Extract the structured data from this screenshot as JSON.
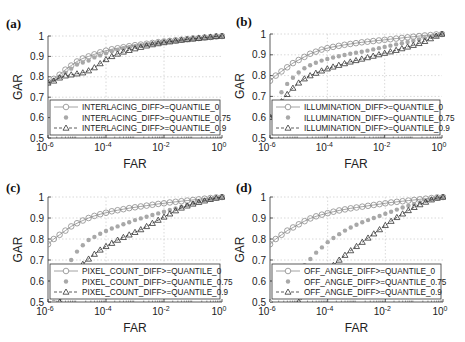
{
  "chart_data": [
    {
      "id": "a",
      "panel_label": "(a)",
      "type": "line",
      "xscale": "log",
      "xlabel": "FAR",
      "ylabel": "GAR",
      "xlim": [
        1e-06,
        1
      ],
      "ylim": [
        0.5,
        1
      ],
      "xticks": [
        {
          "base": "10",
          "exp": "-6"
        },
        {
          "base": "10",
          "exp": "-4"
        },
        {
          "base": "10",
          "exp": "-2"
        },
        {
          "base": "10",
          "exp": "0"
        }
      ],
      "yticks": [
        "0.5",
        "0.6",
        "0.7",
        "0.8",
        "0.9",
        "1"
      ],
      "grid": true,
      "legend_position": "bottom",
      "log10_far": [
        -6.0,
        -5.8,
        -5.6,
        -5.4,
        -5.2,
        -5.0,
        -4.8,
        -4.6,
        -4.4,
        -4.2,
        -4.0,
        -3.8,
        -3.6,
        -3.4,
        -3.2,
        -3.0,
        -2.8,
        -2.6,
        -2.4,
        -2.2,
        -2.0,
        -1.8,
        -1.6,
        -1.4,
        -1.2,
        -1.0,
        -0.8,
        -0.6,
        -0.4,
        -0.2,
        0.0
      ],
      "series": [
        {
          "name": "INTERLACING_DIFF>=QUANTILE_0",
          "marker": "circle",
          "line": "solid",
          "values": [
            0.775,
            0.79,
            0.81,
            0.835,
            0.855,
            0.875,
            0.89,
            0.9,
            0.91,
            0.92,
            0.928,
            0.935,
            0.94,
            0.945,
            0.95,
            0.955,
            0.958,
            0.962,
            0.966,
            0.97,
            0.973,
            0.976,
            0.979,
            0.982,
            0.985,
            0.988,
            0.99,
            0.993,
            0.995,
            0.998,
            1.0
          ]
        },
        {
          "name": "INTERLACING_DIFF>=QUANTILE_0.75",
          "marker": "dot",
          "line": "none",
          "values": [
            0.77,
            0.785,
            0.8,
            0.82,
            0.84,
            0.86,
            0.87,
            0.88,
            0.895,
            0.905,
            0.915,
            0.925,
            0.932,
            0.94,
            0.945,
            0.95,
            0.955,
            0.96,
            0.964,
            0.968,
            0.972,
            0.975,
            0.978,
            0.981,
            0.984,
            0.987,
            0.99,
            0.993,
            0.995,
            0.998,
            1.0
          ]
        },
        {
          "name": "INTERLACING_DIFF>=QUANTILE_0.9",
          "marker": "triangle",
          "line": "dashed",
          "values": [
            0.77,
            0.78,
            0.795,
            0.805,
            0.81,
            0.815,
            0.82,
            0.83,
            0.845,
            0.865,
            0.885,
            0.9,
            0.912,
            0.922,
            0.93,
            0.938,
            0.945,
            0.952,
            0.958,
            0.963,
            0.968,
            0.972,
            0.976,
            0.98,
            0.983,
            0.986,
            0.989,
            0.992,
            0.995,
            0.998,
            1.0
          ]
        }
      ]
    },
    {
      "id": "b",
      "panel_label": "(b)",
      "type": "line",
      "xscale": "log",
      "xlabel": "FAR",
      "ylabel": "GAR",
      "xlim": [
        1e-06,
        1
      ],
      "ylim": [
        0.5,
        1
      ],
      "xticks": [
        {
          "base": "10",
          "exp": "-6"
        },
        {
          "base": "10",
          "exp": "-4"
        },
        {
          "base": "10",
          "exp": "-2"
        },
        {
          "base": "10",
          "exp": "0"
        }
      ],
      "yticks": [
        "0.5",
        "0.6",
        "0.7",
        "0.8",
        "0.9",
        "1"
      ],
      "grid": true,
      "legend_position": "bottom",
      "log10_far": [
        -6.0,
        -5.8,
        -5.6,
        -5.4,
        -5.2,
        -5.0,
        -4.8,
        -4.6,
        -4.4,
        -4.2,
        -4.0,
        -3.8,
        -3.6,
        -3.4,
        -3.2,
        -3.0,
        -2.8,
        -2.6,
        -2.4,
        -2.2,
        -2.0,
        -1.8,
        -1.6,
        -1.4,
        -1.2,
        -1.0,
        -0.8,
        -0.6,
        -0.4,
        -0.2,
        0.0
      ],
      "series": [
        {
          "name": "ILLUMINATION_DIFF>=QUANTILE_0",
          "marker": "circle",
          "line": "solid",
          "values": [
            0.775,
            0.8,
            0.82,
            0.84,
            0.86,
            0.875,
            0.89,
            0.905,
            0.915,
            0.925,
            0.932,
            0.938,
            0.943,
            0.948,
            0.952,
            0.956,
            0.96,
            0.963,
            0.966,
            0.969,
            0.972,
            0.975,
            0.978,
            0.981,
            0.984,
            0.987,
            0.99,
            0.993,
            0.995,
            0.998,
            1.0
          ]
        },
        {
          "name": "ILLUMINATION_DIFF>=QUANTILE_0.75",
          "marker": "dot",
          "line": "none",
          "values": [
            0.6,
            0.67,
            0.72,
            0.76,
            0.79,
            0.815,
            0.835,
            0.85,
            0.862,
            0.872,
            0.88,
            0.887,
            0.893,
            0.899,
            0.905,
            0.91,
            0.915,
            0.92,
            0.926,
            0.932,
            0.938,
            0.944,
            0.95,
            0.956,
            0.962,
            0.968,
            0.974,
            0.98,
            0.987,
            0.993,
            1.0
          ]
        },
        {
          "name": "ILLUMINATION_DIFF>=QUANTILE_0.9",
          "marker": "triangle",
          "line": "dashed",
          "values": [
            0.6,
            0.64,
            0.675,
            0.71,
            0.74,
            0.765,
            0.785,
            0.8,
            0.812,
            0.823,
            0.833,
            0.842,
            0.85,
            0.858,
            0.866,
            0.873,
            0.88,
            0.887,
            0.894,
            0.901,
            0.908,
            0.915,
            0.922,
            0.93,
            0.938,
            0.946,
            0.955,
            0.965,
            0.978,
            0.99,
            1.0
          ]
        }
      ]
    },
    {
      "id": "c",
      "panel_label": "(c)",
      "type": "line",
      "xscale": "log",
      "xlabel": "FAR",
      "ylabel": "GAR",
      "xlim": [
        1e-06,
        1
      ],
      "ylim": [
        0.5,
        1
      ],
      "xticks": [
        {
          "base": "10",
          "exp": "-6"
        },
        {
          "base": "10",
          "exp": "-4"
        },
        {
          "base": "10",
          "exp": "-2"
        },
        {
          "base": "10",
          "exp": "0"
        }
      ],
      "yticks": [
        "0.5",
        "0.6",
        "0.7",
        "0.8",
        "0.9",
        "1"
      ],
      "grid": true,
      "legend_position": "bottom",
      "log10_far": [
        -6.0,
        -5.8,
        -5.6,
        -5.4,
        -5.2,
        -5.0,
        -4.8,
        -4.6,
        -4.4,
        -4.2,
        -4.0,
        -3.8,
        -3.6,
        -3.4,
        -3.2,
        -3.0,
        -2.8,
        -2.6,
        -2.4,
        -2.2,
        -2.0,
        -1.8,
        -1.6,
        -1.4,
        -1.2,
        -1.0,
        -0.8,
        -0.6,
        -0.4,
        -0.2,
        0.0
      ],
      "series": [
        {
          "name": "PIXEL_COUNT_DIFF>=QUANTILE_0",
          "marker": "circle",
          "line": "solid",
          "values": [
            0.775,
            0.8,
            0.82,
            0.84,
            0.86,
            0.875,
            0.888,
            0.9,
            0.91,
            0.918,
            0.925,
            0.932,
            0.937,
            0.942,
            0.947,
            0.951,
            0.955,
            0.959,
            0.963,
            0.967,
            0.97,
            0.974,
            0.977,
            0.98,
            0.983,
            0.986,
            0.989,
            0.992,
            0.995,
            0.998,
            1.0
          ]
        },
        {
          "name": "PIXEL_COUNT_DIFF>=QUANTILE_0.75",
          "marker": "dot",
          "line": "none",
          "values": [
            0.45,
            0.5,
            0.58,
            0.65,
            0.7,
            0.74,
            0.77,
            0.795,
            0.81,
            0.825,
            0.838,
            0.85,
            0.86,
            0.87,
            0.88,
            0.89,
            0.898,
            0.906,
            0.914,
            0.922,
            0.93,
            0.938,
            0.946,
            0.954,
            0.962,
            0.97,
            0.978,
            0.985,
            0.99,
            0.996,
            1.0
          ]
        },
        {
          "name": "PIXEL_COUNT_DIFF>=QUANTILE_0.9",
          "marker": "triangle",
          "line": "dashed",
          "values": [
            0.4,
            0.45,
            0.5,
            0.56,
            0.61,
            0.65,
            0.68,
            0.705,
            0.728,
            0.748,
            0.765,
            0.78,
            0.795,
            0.808,
            0.82,
            0.832,
            0.845,
            0.86,
            0.875,
            0.89,
            0.905,
            0.92,
            0.935,
            0.948,
            0.958,
            0.967,
            0.975,
            0.982,
            0.989,
            0.995,
            1.0
          ]
        }
      ]
    },
    {
      "id": "d",
      "panel_label": "(d)",
      "type": "line",
      "xscale": "log",
      "xlabel": "FAR",
      "ylabel": "GAR",
      "xlim": [
        1e-06,
        1
      ],
      "ylim": [
        0.5,
        1
      ],
      "xticks": [
        {
          "base": "10",
          "exp": "-6"
        },
        {
          "base": "10",
          "exp": "-4"
        },
        {
          "base": "10",
          "exp": "-2"
        },
        {
          "base": "10",
          "exp": "0"
        }
      ],
      "yticks": [
        "0.5",
        "0.6",
        "0.7",
        "0.8",
        "0.9",
        "1"
      ],
      "grid": true,
      "legend_position": "bottom",
      "log10_far": [
        -6.0,
        -5.8,
        -5.6,
        -5.4,
        -5.2,
        -5.0,
        -4.8,
        -4.6,
        -4.4,
        -4.2,
        -4.0,
        -3.8,
        -3.6,
        -3.4,
        -3.2,
        -3.0,
        -2.8,
        -2.6,
        -2.4,
        -2.2,
        -2.0,
        -1.8,
        -1.6,
        -1.4,
        -1.2,
        -1.0,
        -0.8,
        -0.6,
        -0.4,
        -0.2,
        0.0
      ],
      "series": [
        {
          "name": "OFF_ANGLE_DIFF>=QUANTILE_0",
          "marker": "circle",
          "line": "solid",
          "values": [
            0.775,
            0.8,
            0.82,
            0.84,
            0.855,
            0.87,
            0.885,
            0.898,
            0.908,
            0.916,
            0.923,
            0.93,
            0.936,
            0.941,
            0.946,
            0.95,
            0.954,
            0.958,
            0.962,
            0.966,
            0.97,
            0.974,
            0.977,
            0.98,
            0.983,
            0.986,
            0.989,
            0.992,
            0.995,
            0.998,
            1.0
          ]
        },
        {
          "name": "OFF_ANGLE_DIFF>=QUANTILE_0.75",
          "marker": "dot",
          "line": "none",
          "values": [
            0.5,
            0.53,
            0.555,
            0.585,
            0.615,
            0.645,
            0.675,
            0.705,
            0.735,
            0.76,
            0.785,
            0.805,
            0.823,
            0.84,
            0.855,
            0.868,
            0.88,
            0.89,
            0.9,
            0.91,
            0.92,
            0.93,
            0.94,
            0.95,
            0.958,
            0.966,
            0.974,
            0.982,
            0.989,
            0.995,
            1.0
          ]
        },
        {
          "name": "OFF_ANGLE_DIFF>=QUANTILE_0.9",
          "marker": "triangle",
          "line": "dashed",
          "values": [
            0.35,
            0.38,
            0.41,
            0.44,
            0.47,
            0.5,
            0.53,
            0.56,
            0.59,
            0.62,
            0.65,
            0.675,
            0.7,
            0.723,
            0.745,
            0.765,
            0.785,
            0.805,
            0.825,
            0.845,
            0.865,
            0.885,
            0.903,
            0.92,
            0.936,
            0.951,
            0.964,
            0.976,
            0.987,
            0.995,
            1.0
          ]
        }
      ]
    }
  ]
}
